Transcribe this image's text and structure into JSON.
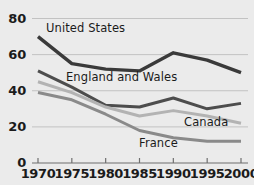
{
  "chart_data": {
    "type": "line",
    "title": "",
    "subtitle": "",
    "xlabel": "",
    "ylabel": "",
    "x": [
      1970,
      1975,
      1980,
      1985,
      1990,
      1995,
      2000
    ],
    "xtick_labels": [
      "1970",
      "1975",
      "1980",
      "1985",
      "1990",
      "1995",
      "2000"
    ],
    "ytick_labels": [
      "0",
      "20",
      "40",
      "60",
      "80"
    ],
    "yticks": [
      0,
      20,
      40,
      60,
      80
    ],
    "ylim": [
      0,
      80
    ],
    "xlim": [
      1970,
      2000
    ],
    "grid": "horizontal",
    "legend_position": "inline-labels",
    "series": [
      {
        "name": "United States",
        "values": [
          70,
          55,
          52,
          51,
          61,
          57,
          50
        ],
        "color": "#3a3a3a",
        "width": 3.4,
        "label_x": 46,
        "label_y": 21
      },
      {
        "name": "England and Wales",
        "values": [
          51,
          42,
          32,
          31,
          36,
          30,
          33
        ],
        "color": "#4d4d4d",
        "width": 3.0,
        "label_x": 66,
        "label_y": 70
      },
      {
        "name": "Canada",
        "values": [
          45,
          39,
          31,
          26,
          29,
          26,
          22
        ],
        "color": "#b3b3b3",
        "width": 3.0,
        "label_x": 184,
        "label_y": 115
      },
      {
        "name": "France",
        "values": [
          39,
          35,
          27,
          18,
          14,
          12,
          12
        ],
        "color": "#8a8a8a",
        "width": 3.0,
        "label_x": 139,
        "label_y": 136
      }
    ],
    "axis_color": "#6f6f6f",
    "grid_color": "#c2c2c2",
    "background": "#ebebeb",
    "text_color": "#1b1b1b"
  }
}
